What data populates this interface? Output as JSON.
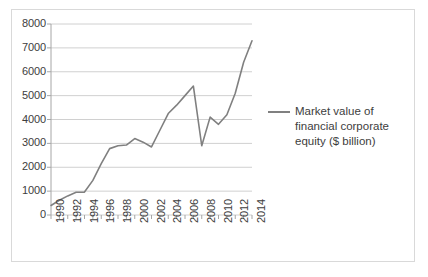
{
  "chart_data": {
    "type": "line",
    "title": "",
    "xlabel": "",
    "ylabel": "",
    "ylim": [
      0,
      8000
    ],
    "xlim": [
      1990,
      2014
    ],
    "grid": true,
    "legend_position": "right",
    "y_ticks": [
      "8000",
      "7000",
      "6000",
      "5000",
      "4000",
      "3000",
      "2000",
      "1000",
      "0"
    ],
    "y_tick_values": [
      8000,
      7000,
      6000,
      5000,
      4000,
      3000,
      2000,
      1000,
      0
    ],
    "x_ticks": [
      "1990",
      "1992",
      "1994",
      "1996",
      "1998",
      "2000",
      "2002",
      "2004",
      "2006",
      "2008",
      "2010",
      "2012",
      "2014"
    ],
    "x_tick_values": [
      1990,
      1992,
      1994,
      1996,
      1998,
      2000,
      2002,
      2004,
      2006,
      2008,
      2010,
      2012,
      2014
    ],
    "series": [
      {
        "name": "Market value of financial corporate equity ($ billion)",
        "color": "#808080",
        "x": [
          1990,
          1991,
          1992,
          1993,
          1994,
          1995,
          1996,
          1997,
          1998,
          1999,
          2000,
          2001,
          2002,
          2003,
          2004,
          2005,
          2006,
          2007,
          2008,
          2009,
          2010,
          2011,
          2012,
          2013,
          2014
        ],
        "values": [
          400,
          620,
          800,
          950,
          960,
          1450,
          2150,
          2780,
          2900,
          2930,
          3200,
          3050,
          2850,
          3550,
          4250,
          4600,
          5000,
          5400,
          2900,
          4100,
          3800,
          4200,
          5100,
          6400,
          7300
        ]
      }
    ]
  },
  "legend": {
    "label": "Market value of financial corporate equity ($ billion)",
    "swatch_color": "#808080"
  },
  "axes": {
    "axis_color": "#a6a6a6",
    "grid_color": "#d0d0d0",
    "frame_color": "#d9d9d9"
  }
}
